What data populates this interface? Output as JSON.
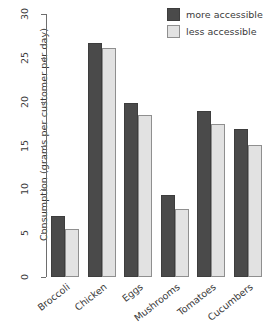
{
  "chart_data": {
    "type": "bar",
    "title": "",
    "xlabel": "",
    "ylabel": "Consumption (grams per customer per day)",
    "categories": [
      "Broccoli",
      "Chicken",
      "Eggs",
      "Mushrooms",
      "Tomatoes",
      "Cucumbers"
    ],
    "series": [
      {
        "name": "more accessible",
        "color": "#4a4a4a",
        "values": [
          7.0,
          26.7,
          19.9,
          9.3,
          18.9,
          16.9
        ]
      },
      {
        "name": "less accessible",
        "color": "#e2e2e2",
        "values": [
          5.5,
          26.1,
          18.5,
          7.8,
          17.4,
          15.1
        ]
      }
    ],
    "ylim": [
      0,
      30
    ],
    "yticks": [
      0,
      5,
      10,
      15,
      20,
      25,
      30
    ],
    "ytick_labels": [
      "0",
      "5",
      "10",
      "15",
      "20",
      "25",
      "30"
    ],
    "grid": false,
    "legend_position": "top-right",
    "x_label_rotation": -38,
    "y_label_rotation": -90
  },
  "legend": {
    "entries": [
      {
        "label": "more accessible",
        "swatch": "more"
      },
      {
        "label": "less accessible",
        "swatch": "less"
      }
    ]
  }
}
